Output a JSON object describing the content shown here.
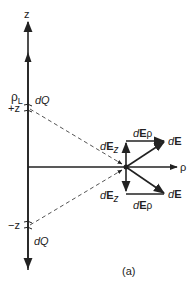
{
  "figure": {
    "caption": "(a)",
    "axes": {
      "z_axis_label": "z",
      "rho_axis_label": "ρ",
      "line_charge_label_main": "ρ",
      "line_charge_label_sub": "L"
    },
    "upper_charge": {
      "position_label": "+z",
      "charge_label": "dQ"
    },
    "lower_charge": {
      "position_label": "−z",
      "charge_label": "dQ"
    },
    "upper_vectors": {
      "dEz_d": "d",
      "dEz_E": "E",
      "dEz_sub": "z",
      "dErho_d": "d",
      "dErho_E": "E",
      "dErho_sub": "ρ",
      "dE_d": "d",
      "dE_E": "E"
    },
    "lower_vectors": {
      "dEz_d": "d",
      "dEz_E": "E",
      "dEz_sub": "z",
      "dErho_d": "d",
      "dErho_E": "E",
      "dErho_sub": "ρ",
      "dE_d": "d",
      "dE_E": "E"
    },
    "colors": {
      "line": "#222222",
      "dashed": "#555555"
    }
  }
}
